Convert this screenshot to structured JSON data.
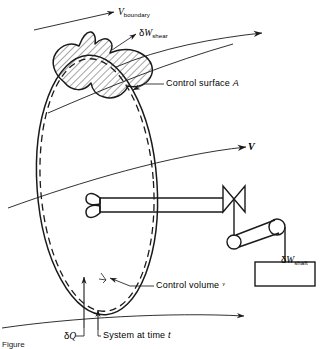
{
  "figure": {
    "domain_type": "diagram",
    "stroke_color": "#1a1a1a",
    "background_color": "#ffffff",
    "hatch_color": "#2b2b2b"
  },
  "labels": {
    "v_boundary": {
      "symbol": "V",
      "subscript": "boundary",
      "name": "boundary-velocity"
    },
    "w_shear": {
      "delta": "δ",
      "symbol": "W",
      "subscript": "shear",
      "name": "shear-work"
    },
    "control_surface": {
      "text": "Control  surface",
      "symbol": "A"
    },
    "velocity": {
      "symbol": "V"
    },
    "w_shaft": {
      "delta": "δ",
      "symbol": "W",
      "subscript": "shaft"
    },
    "control_volume": {
      "text": "Control  volume",
      "symbol": "ᵛ"
    },
    "delta_q": {
      "delta": "δ",
      "symbol": "Q"
    },
    "system_at_time": {
      "text": "System  at  time",
      "symbol": "t"
    },
    "caption": "Figure"
  },
  "elements": {
    "control_surface_ellipse": "solid-ellipse",
    "control_volume_dashed": "dashed-ellipse",
    "system_boundary_blob": "hatched-irregular-region",
    "paddle_wheel": "bowtie-paddle-on-shaft",
    "pulley_large": "spool-pulley",
    "pulley_small": "belt-pulley",
    "weight": "rectangular-block",
    "heat_arrow": "upward-arrow",
    "streamlines": 4
  },
  "colors": {
    "ink": "#1a1a1a",
    "paper": "#ffffff"
  }
}
